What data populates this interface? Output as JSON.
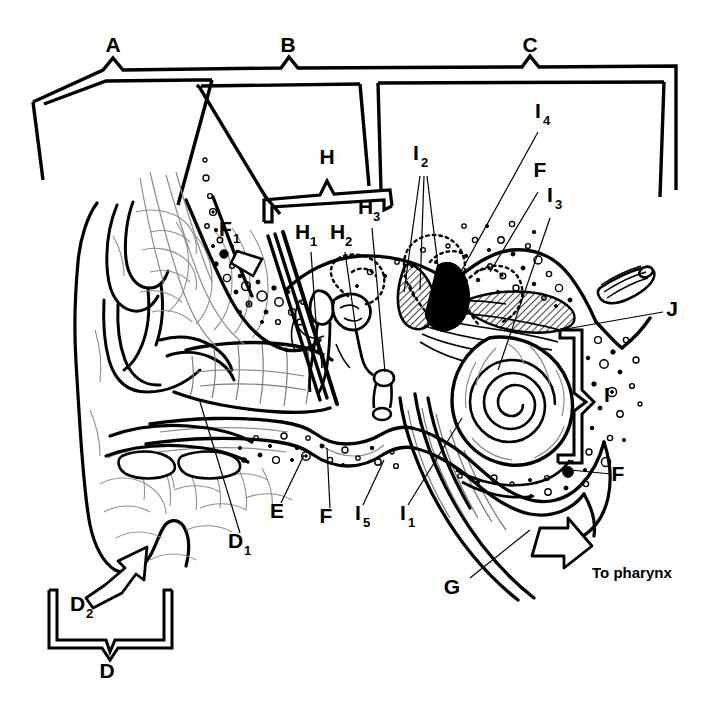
{
  "figure": {
    "type": "anatomical-diagram",
    "background_color": "#ffffff",
    "line_color": "#000000"
  },
  "region_brackets": [
    {
      "id": "A",
      "label": "A",
      "orientation": "top",
      "spans": "outer-ear"
    },
    {
      "id": "B",
      "label": "B",
      "orientation": "top",
      "spans": "middle-ear"
    },
    {
      "id": "C",
      "label": "C",
      "orientation": "top",
      "spans": "inner-ear"
    },
    {
      "id": "D",
      "label": "D",
      "orientation": "bottom",
      "spans": "auricle-lower"
    },
    {
      "id": "H",
      "label": "H",
      "orientation": "top",
      "spans": "ossicles"
    },
    {
      "id": "I",
      "label": "I",
      "orientation": "right",
      "spans": "labyrinth"
    }
  ],
  "labels": [
    {
      "id": "A",
      "letter": "A",
      "subscript": "",
      "x": 113,
      "y": 52
    },
    {
      "id": "B",
      "letter": "B",
      "subscript": "",
      "x": 288,
      "y": 52
    },
    {
      "id": "C",
      "letter": "C",
      "subscript": "",
      "x": 530,
      "y": 52
    },
    {
      "id": "D",
      "letter": "D",
      "subscript": "",
      "x": 107,
      "y": 678
    },
    {
      "id": "D1",
      "letter": "D",
      "subscript": "1",
      "x": 236,
      "y": 548
    },
    {
      "id": "D2",
      "letter": "D",
      "subscript": "2",
      "x": 81,
      "y": 611
    },
    {
      "id": "E",
      "letter": "E",
      "subscript": "",
      "x": 277,
      "y": 518
    },
    {
      "id": "F",
      "letter": "F",
      "subscript": "",
      "x": 326,
      "y": 523
    },
    {
      "id": "F1",
      "letter": "F",
      "subscript": "1",
      "x": 227,
      "y": 236
    },
    {
      "id": "Fr",
      "letter": "F",
      "subscript": "",
      "x": 618,
      "y": 481
    },
    {
      "id": "Ft",
      "letter": "F",
      "subscript": "",
      "x": 540,
      "y": 177
    },
    {
      "id": "G",
      "letter": "G",
      "subscript": "",
      "x": 452,
      "y": 594
    },
    {
      "id": "H",
      "letter": "H",
      "subscript": "",
      "x": 327,
      "y": 164
    },
    {
      "id": "H1",
      "letter": "H",
      "subscript": "1",
      "x": 303,
      "y": 239
    },
    {
      "id": "H2",
      "letter": "H",
      "subscript": "2",
      "x": 338,
      "y": 239
    },
    {
      "id": "H3",
      "letter": "H",
      "subscript": "3",
      "x": 367,
      "y": 214
    },
    {
      "id": "I",
      "letter": "I",
      "subscript": "",
      "x": 607,
      "y": 402
    },
    {
      "id": "I1",
      "letter": "I",
      "subscript": "1",
      "x": 405,
      "y": 520
    },
    {
      "id": "I2",
      "letter": "I",
      "subscript": "2",
      "x": 418,
      "y": 160
    },
    {
      "id": "I3",
      "letter": "I",
      "subscript": "3",
      "x": 552,
      "y": 202
    },
    {
      "id": "I4",
      "letter": "I",
      "subscript": "4",
      "x": 540,
      "y": 118
    },
    {
      "id": "I5",
      "letter": "I",
      "subscript": "5",
      "x": 360,
      "y": 520
    },
    {
      "id": "J",
      "letter": "J",
      "subscript": "",
      "x": 672,
      "y": 316
    }
  ],
  "annotations": [
    {
      "id": "to-pharynx",
      "text": "To pharynx",
      "x": 592,
      "y": 578,
      "has_arrow": true
    }
  ],
  "leader_lines": [
    {
      "from": "D1",
      "to": "auricle-cartilage"
    },
    {
      "from": "D2",
      "to": "lobule",
      "style": "block-arrow"
    },
    {
      "from": "E",
      "to": "tympanic-cavity-floor"
    },
    {
      "from": "F",
      "to": "temporal-bone"
    },
    {
      "from": "F1",
      "to": "mastoid-bone",
      "style": "block-pointer"
    },
    {
      "from": "G",
      "to": "eustachian-tube"
    },
    {
      "from": "H1",
      "to": "malleus"
    },
    {
      "from": "H2",
      "to": "incus"
    },
    {
      "from": "H3",
      "to": "stapes"
    },
    {
      "from": "I1",
      "to": "cochlea"
    },
    {
      "from": "I2",
      "to": "semicircular-canals"
    },
    {
      "from": "I3",
      "to": "cochlear-duct"
    },
    {
      "from": "I4",
      "to": "vestibule"
    },
    {
      "from": "I5",
      "to": "round-window"
    },
    {
      "from": "J",
      "to": "vestibulocochlear-nerve"
    }
  ]
}
